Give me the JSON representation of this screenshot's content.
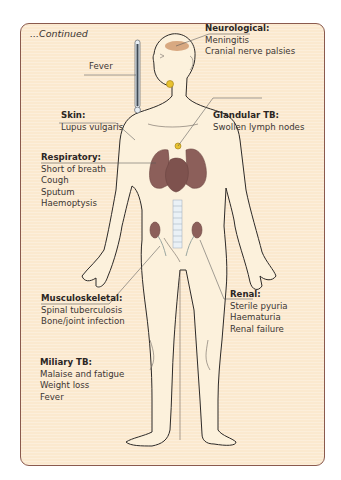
{
  "caption": "...Continued",
  "colors": {
    "panel_bg": "#fbe9cf",
    "panel_border": "#8a5a4e",
    "body_fill": "#fcf1dc",
    "organ": "#8c5f5a",
    "lymph_node": "#e8c230",
    "meningitis_spot": "#c98a5a",
    "text": "#3b3633"
  },
  "labels": {
    "fever": {
      "text": "Fever"
    },
    "neurological": {
      "heading": "Neurological:",
      "items": [
        "Meningitis",
        "Cranial nerve palsies"
      ]
    },
    "skin": {
      "heading": "Skin:",
      "items": [
        "Lupus vulgaris"
      ]
    },
    "glandular": {
      "heading": "Glandular TB:",
      "items": [
        "Swollen lymph nodes"
      ]
    },
    "respiratory": {
      "heading": "Respiratory:",
      "items": [
        "Short of breath",
        "Cough",
        "Sputum",
        "Haemoptysis"
      ]
    },
    "musculoskeletal": {
      "heading": "Musculoskeletal:",
      "items": [
        "Spinal tuberculosis",
        "Bone/joint infection"
      ]
    },
    "renal": {
      "heading": "Renal:",
      "items": [
        "Sterile pyuria",
        "Haematuria",
        "Renal failure"
      ]
    },
    "miliary": {
      "heading": "Miliary TB:",
      "items": [
        "Malaise and fatigue",
        "Weight loss",
        "Fever"
      ]
    }
  }
}
